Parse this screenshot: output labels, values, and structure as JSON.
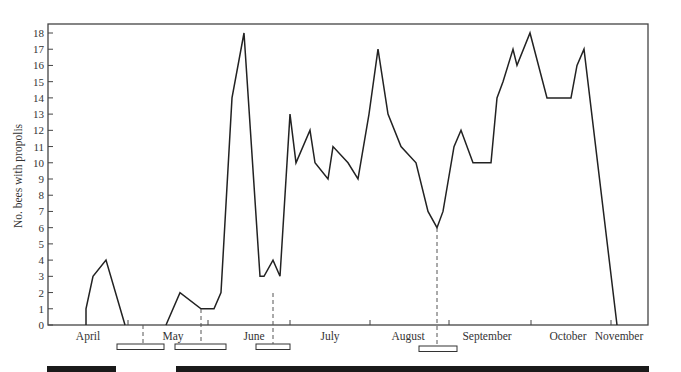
{
  "chart_data": {
    "type": "line",
    "title": "",
    "xlabel": "",
    "ylabel": "No. bees with propolis",
    "ylim": [
      0,
      18
    ],
    "yticks": [
      0,
      1,
      2,
      3,
      4,
      5,
      6,
      7,
      8,
      9,
      10,
      11,
      12,
      13,
      14,
      15,
      16,
      17,
      18
    ],
    "grid": false,
    "legend": null,
    "months": [
      "April",
      "May",
      "June",
      "July",
      "August",
      "September",
      "October",
      "November"
    ],
    "series": [
      {
        "name": "No. bees with propolis",
        "segments": [
          {
            "x_px": [
              86,
              86,
              93,
              106,
              125
            ],
            "values": [
              0,
              1,
              3,
              4,
              0
            ]
          },
          {
            "x_px": [
              166,
              180,
              201,
              214,
              221,
              232,
              244,
              260,
              264,
              273,
              280,
              290,
              296,
              310,
              315,
              328,
              333,
              348,
              358,
              369,
              378,
              388,
              401,
              416,
              428,
              437,
              443,
              454,
              461,
              473,
              491,
              497,
              503,
              513,
              517,
              530,
              547,
              571,
              577,
              584,
              617
            ],
            "values": [
              0,
              2,
              1,
              1,
              2,
              14,
              18,
              3,
              3,
              4,
              3,
              13,
              10,
              12,
              10,
              9,
              11,
              10,
              9,
              13,
              17,
              13,
              11,
              10,
              7,
              6,
              7,
              11,
              12,
              10,
              10,
              14,
              15,
              17,
              16,
              18,
              14,
              14,
              16,
              17,
              0
            ]
          }
        ]
      }
    ],
    "annotations": {
      "open_bars": [
        {
          "x1": 117,
          "x2": 164
        },
        {
          "x1": 175,
          "x2": 226
        },
        {
          "x1": 256,
          "x2": 290
        },
        {
          "x1": 419,
          "x2": 457
        }
      ],
      "dashed_markers_x": [
        143,
        201,
        273,
        437
      ],
      "solid_bars": [
        {
          "x1": 47,
          "x2": 116
        },
        {
          "x1": 176,
          "x2": 649
        }
      ]
    }
  }
}
